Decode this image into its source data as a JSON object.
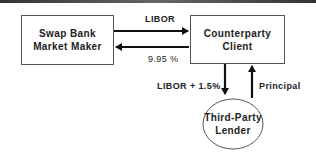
{
  "diagram": {
    "nodes": {
      "swap_bank": {
        "line1": "Swap Bank",
        "line2": "Market Maker"
      },
      "counterparty": {
        "line1": "Counterparty",
        "line2": "Client"
      },
      "lender": {
        "line1": "Third-Party",
        "line2": "Lender"
      }
    },
    "edges": {
      "libor": "LIBOR",
      "fixed": "9.95 %",
      "libor_plus": "LIBOR + 1.5%",
      "principal": "Principal"
    }
  }
}
